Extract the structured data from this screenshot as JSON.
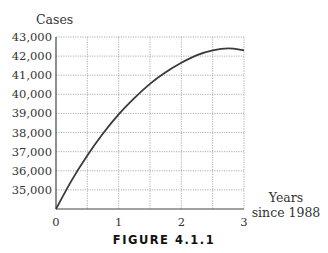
{
  "figure": {
    "caption": "FIGURE 4.1.1"
  },
  "chart_data": {
    "type": "line",
    "title": "",
    "xlabel": "Years since 1988",
    "xlabel_lines": [
      "Years",
      "since 1988"
    ],
    "ylabel": "Cases",
    "xlim": [
      0,
      3
    ],
    "ylim": [
      34000,
      43000
    ],
    "x_ticks": [
      0,
      1,
      2,
      3
    ],
    "x_tick_labels": [
      "0",
      "1",
      "2",
      "3"
    ],
    "y_ticks": [
      35000,
      36000,
      37000,
      38000,
      39000,
      40000,
      41000,
      42000,
      43000
    ],
    "y_tick_labels": [
      "35,000",
      "36,000",
      "37,000",
      "38,000",
      "39,000",
      "40,000",
      "41,000",
      "42,000",
      "43,000"
    ],
    "grid": true,
    "legend": null,
    "series": [
      {
        "name": "Cases",
        "x": [
          0,
          0.25,
          0.5,
          0.75,
          1,
          1.25,
          1.5,
          1.75,
          2,
          2.25,
          2.5,
          2.75,
          3
        ],
        "values": [
          34000,
          35500,
          36800,
          37950,
          38950,
          39800,
          40550,
          41150,
          41650,
          42050,
          42300,
          42400,
          42300
        ]
      }
    ]
  }
}
